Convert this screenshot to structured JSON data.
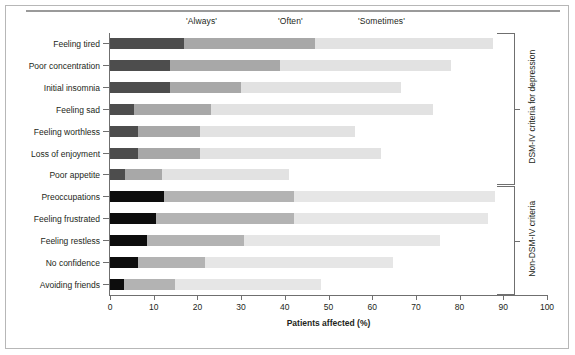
{
  "chart_data": {
    "type": "bar",
    "subtype": "stacked-horizontal",
    "title": "",
    "xlabel": "Patients affected (%)",
    "ylabel": "",
    "xlim": [
      0,
      100
    ],
    "xticks": [
      0,
      10,
      20,
      30,
      40,
      50,
      60,
      70,
      80,
      90,
      100
    ],
    "grid": false,
    "legend_position": "top",
    "column_headers": [
      "'Always'",
      "'Often'",
      "'Sometimes'"
    ],
    "series": [
      {
        "name": "'Always'",
        "color": "#4d4d4d",
        "values": [
          17.0,
          13.7,
          13.7,
          5.5,
          6.4,
          6.4,
          3.5,
          12.4,
          10.6,
          8.5,
          6.4,
          3.2
        ]
      },
      {
        "name": "'Often'",
        "color": "#a8a8a8",
        "values": [
          30.0,
          25.3,
          16.3,
          17.5,
          14.1,
          14.1,
          8.5,
          29.6,
          31.4,
          22.1,
          15.3,
          11.6
        ]
      },
      {
        "name": "'Sometimes'",
        "color": "#e2e2e2",
        "values": [
          40.6,
          39.0,
          36.5,
          51.0,
          35.5,
          41.5,
          29.0,
          46.0,
          44.5,
          44.9,
          43.1,
          33.5
        ]
      }
    ],
    "categories": [
      "Feeling tired",
      "Poor concentration",
      "Initial insomnia",
      "Feeling sad",
      "Feeling worthless",
      "Loss of enjoyment",
      "Poor appetite",
      "Preoccupations",
      "Feeling frustrated",
      "Feeling restless",
      "No confidence",
      "Avoiding friends"
    ],
    "cumulative_totals": [
      87.6,
      78.0,
      66.5,
      74.0,
      56.0,
      62.0,
      41.0,
      88.0,
      86.5,
      75.5,
      64.8,
      48.3
    ],
    "groups": [
      {
        "label": "DSM-IV criteria for depression",
        "first_index": 0,
        "last_index": 6
      },
      {
        "label": "Non-DSM-IV criteria",
        "first_index": 7,
        "last_index": 11
      }
    ]
  },
  "colors": {
    "always_light_group": "#4d4d4d",
    "often_light_group": "#a8a8a8",
    "sometimes_light_group": "#e2e2e2",
    "always_dark_group": "#0d0d0d",
    "often_dark_group": "#b3b3b3",
    "sometimes_dark_group": "#e6e6e6",
    "axis": "#6f6f6f",
    "text": "#231f20",
    "frame": "#b7b7b7",
    "top_rule": "#9a9a9a"
  }
}
